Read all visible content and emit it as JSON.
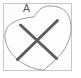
{
  "diagram": {
    "label": "A",
    "region_path": "M 34,17 C 38,10 43,6 49,6 C 55,6 61,7 65,11 C 69,15 71,21 71,28 C 71,37 67,47 61,54 C 57,59 51,64 46,68 L 44,70 C 43,70 36,69.5 29,66.5 C 21,63 12,56 8,48 C 5,42 4,35 6,30 C 8,25 13,22 20,19.5 C 25,18 30,17.2 34,17 Z",
    "cross_path": "M 20.5 25 L 56.5 58.5 M 17.5 59.5 L 57.5 20.5",
    "colors": {
      "frame_border": "#c7c7c7",
      "background": "#fdfdfd",
      "region_outline": "#909090",
      "cross": "#5e5e5e",
      "label": "#565656"
    }
  }
}
